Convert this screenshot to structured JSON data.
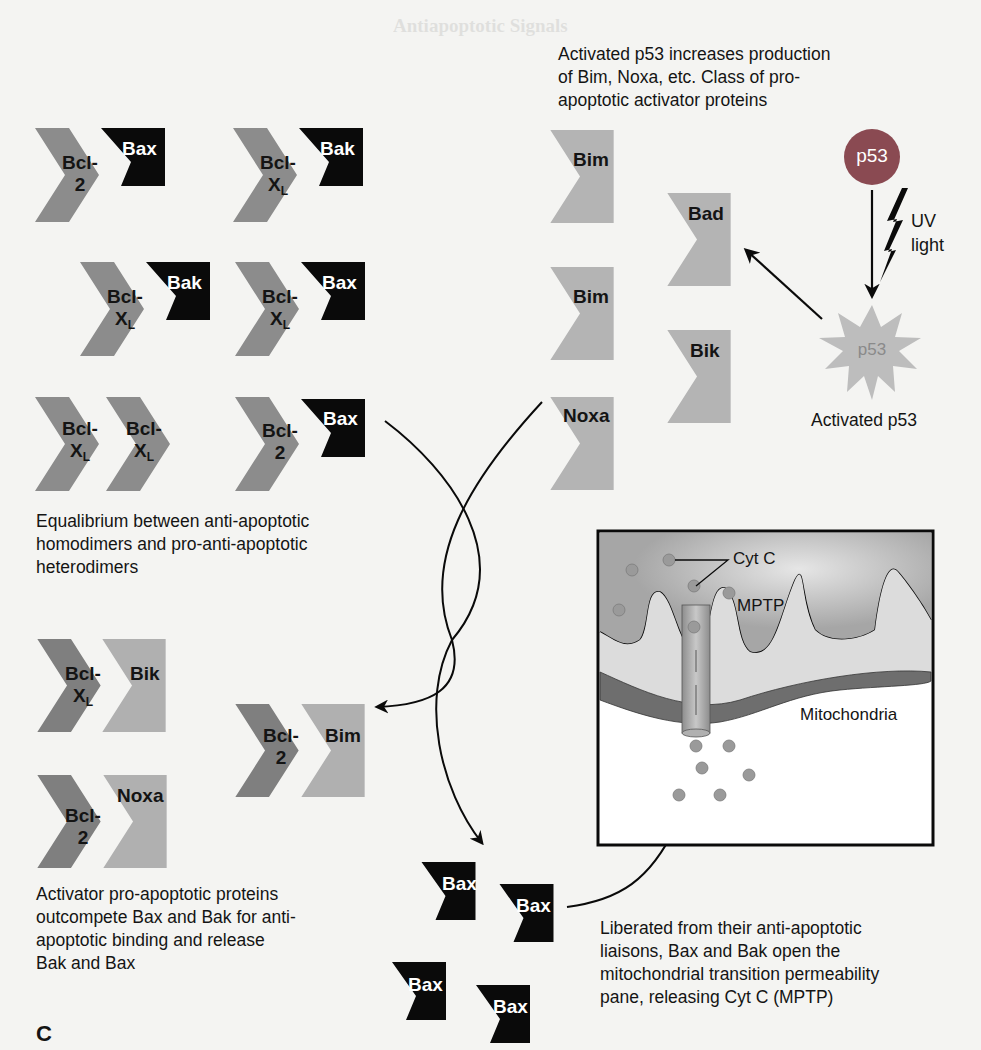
{
  "figure": {
    "panel_letter": "C",
    "background_bleed_heading": "Antiapoptotic Signals"
  },
  "captions": {
    "activator_production": [
      "Activated p53 increases production",
      "of Bim, Noxa, etc. Class of pro-",
      "apoptotic activator proteins"
    ],
    "equilibrium": [
      "Equalibrium between anti-apoptotic",
      "homodimers and pro-anti-apoptotic",
      "heterodimers"
    ],
    "outcompete": [
      "Activator pro-apoptotic proteins",
      "outcompete Bax and Bak for anti-",
      "apoptotic binding and release",
      "Bak and Bax"
    ],
    "liberated": [
      "Liberated from their anti-apoptotic",
      "liaisons, Bax and Bak open the",
      "mitochondrial transition permeability",
      "pane, releasing Cyt C (MPTP)"
    ]
  },
  "p53": {
    "inactive_label": "p53",
    "activated_label": "p53",
    "activated_caption": "Activated p53",
    "stimulus_line1": "UV",
    "stimulus_line2": "light"
  },
  "mitochondria": {
    "label": "Mitochondria",
    "cytc_label": "Cyt C",
    "mptp_label": "MPTP"
  },
  "dimers_equilibrium": [
    {
      "left": {
        "name": "Bcl-",
        "sub": "",
        "line2": "2"
      },
      "right": "Bax",
      "right_type": "black"
    },
    {
      "left": {
        "name": "Bcl-",
        "sub": "L",
        "line2": "X"
      },
      "right": "Bak",
      "right_type": "black"
    },
    {
      "left": {
        "name": "Bcl-",
        "sub": "L",
        "line2": "X"
      },
      "right": "Bak",
      "right_type": "black"
    },
    {
      "left": {
        "name": "Bcl-",
        "sub": "L",
        "line2": "X"
      },
      "right": "Bax",
      "right_type": "black"
    },
    {
      "left": {
        "name": "Bcl-",
        "sub": "L",
        "line2": "X"
      },
      "right": "Bcl-XL",
      "right_type": "chevron"
    },
    {
      "left": {
        "name": "Bcl-",
        "sub": "",
        "line2": "2"
      },
      "right": "Bax",
      "right_type": "black"
    }
  ],
  "dimers_activator": [
    {
      "left": {
        "name": "Bcl-",
        "sub": "L",
        "line2": "X"
      },
      "right": "Bik"
    },
    {
      "left": {
        "name": "Bcl-",
        "sub": "",
        "line2": "2"
      },
      "right": "Noxa"
    },
    {
      "left": {
        "name": "Bcl-",
        "sub": "",
        "line2": "2"
      },
      "right": "Bim"
    }
  ],
  "activators": [
    "Bim",
    "Bad",
    "Bim",
    "Bik",
    "Noxa"
  ],
  "released": [
    "Bax",
    "Bax",
    "Bax",
    "Bax"
  ],
  "colors": {
    "anti_apoptotic": "#8c8c8c",
    "anti_apoptotic_dark": "#7f7f7f",
    "activator": "#b4b4b4",
    "effector": "#0a0a0a",
    "p53_inactive": "#8a4a52",
    "p53_activated": "#bdbdbd",
    "matrix": "#a9a9a9",
    "intermembrane": "#dcdcdc",
    "outer_membrane": "#6e6e6e",
    "cytc": "#9a9a9a"
  }
}
